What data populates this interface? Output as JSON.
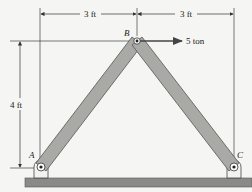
{
  "diagram": {
    "type": "truss-two-member",
    "colors": {
      "member_fill": "#a9a9a6",
      "member_stroke": "#555555",
      "ground_fill": "#8a8a88",
      "line": "#333333",
      "background": "#f5f5f3"
    },
    "joints": {
      "A": {
        "label": "A",
        "x": 41,
        "y": 167
      },
      "B": {
        "label": "B",
        "x": 137,
        "y": 41
      },
      "C": {
        "label": "C",
        "x": 234,
        "y": 167
      }
    },
    "dimensions": {
      "left_span": "3 ft",
      "right_span": "3 ft",
      "height": "4 ft"
    },
    "load": {
      "label": "5 ton",
      "direction": "right",
      "at_joint": "B"
    }
  }
}
